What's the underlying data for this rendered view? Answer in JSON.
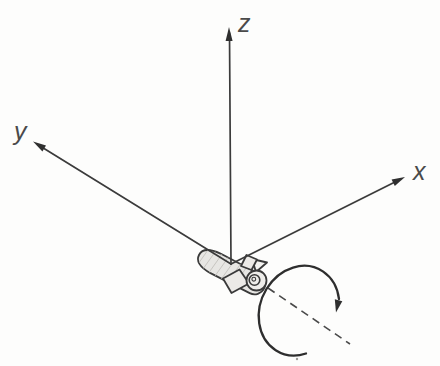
{
  "figure": {
    "kind": "3d-coordinate-rocket-spin-diagram",
    "axes": {
      "z_label": "z",
      "y_label": "y",
      "x_label": "x"
    },
    "icons": {
      "rocket": "rocket-icon",
      "rotation_arrow": "rotation-arrow-icon",
      "spin_axis": "dashed-spin-axis"
    },
    "colors": {
      "background": "#fdfdfc",
      "line": "#3b3b3b",
      "label": "#4a4a4a",
      "rocket_fill": "#e7e6e3",
      "fin_fill": "#eceae7"
    }
  }
}
